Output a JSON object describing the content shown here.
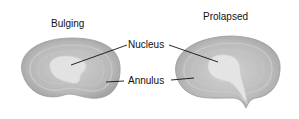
{
  "diagram": {
    "titles": {
      "left": "Bulging",
      "right": "Prolapsed"
    },
    "labels": {
      "nucleus": "Nucleus",
      "annulus": "Annulus"
    },
    "colors": {
      "annulus_outer": "#a9a9a9",
      "annulus_ring": "#bdbdbd",
      "nucleus": "#e3e3e3",
      "leader_line": "#111111"
    }
  }
}
